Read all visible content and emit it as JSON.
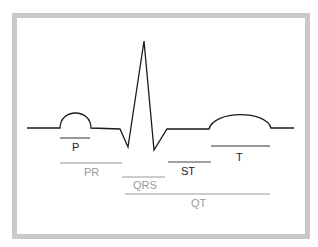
{
  "diagram": {
    "colors": {
      "frame": "#c9c9c9",
      "trace": "#1a1a1a",
      "primary_label": "#222222",
      "secondary_label": "#9a9a9a"
    },
    "segments": [
      {
        "id": "p",
        "label": "P",
        "style": "dark"
      },
      {
        "id": "pr",
        "label": "PR",
        "style": "light"
      },
      {
        "id": "qrs",
        "label": "QRS",
        "style": "light"
      },
      {
        "id": "st",
        "label": "ST",
        "style": "dark"
      },
      {
        "id": "t",
        "label": "T",
        "style": "dark"
      },
      {
        "id": "qt",
        "label": "QT",
        "style": "light"
      }
    ]
  }
}
